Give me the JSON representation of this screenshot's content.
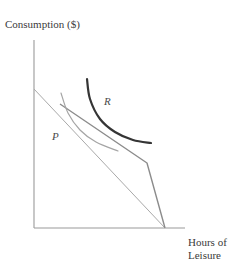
{
  "figure": {
    "type": "economics-indifference-curve-diagram",
    "background_color": "#ffffff",
    "axis_color": "#9a9a9a",
    "y_axis_label": "Consumption ($)",
    "x_axis_label_line1": "Hours of",
    "x_axis_label_line2": "Leisure",
    "curve_labels": {
      "p": "P",
      "r": "R"
    }
  },
  "chart_data": {
    "type": "line",
    "title": "",
    "xlabel": "Hours of Leisure",
    "ylabel": "Consumption ($)",
    "grid": false,
    "legend": "none",
    "axes": {
      "origin_px": [
        34,
        228
      ],
      "x_axis_end_px": [
        185,
        228
      ],
      "y_axis_top_px": [
        34,
        40
      ],
      "xlim_px": [
        34,
        185
      ],
      "ylim_px": [
        228,
        40
      ]
    },
    "series": [
      {
        "name": "original-budget-line",
        "role": "straight budget constraint",
        "color": "#a9a9a9",
        "width": 1,
        "points_px": [
          [
            34,
            89
          ],
          [
            165,
            228
          ]
        ]
      },
      {
        "name": "kinked-budget-line",
        "role": "piecewise budget constraint with welfare program kink",
        "color": "#8c8c8c",
        "width": 1.4,
        "points_px": [
          [
            60,
            104
          ],
          [
            147,
            163
          ],
          [
            165,
            228
          ]
        ]
      },
      {
        "name": "indifference-curve-P",
        "label": "P",
        "color": "#a5a5a5",
        "width": 1.2,
        "points_px": [
          [
            61,
            93
          ],
          [
            68,
            113
          ],
          [
            80,
            130
          ],
          [
            96,
            142
          ],
          [
            118,
            151
          ]
        ]
      },
      {
        "name": "indifference-curve-R",
        "label": "R",
        "color": "#353535",
        "width": 2.2,
        "points_px": [
          [
            87,
            79
          ],
          [
            90,
            99
          ],
          [
            100,
            119
          ],
          [
            115,
            132
          ],
          [
            133,
            140
          ],
          [
            151,
            143
          ]
        ]
      }
    ],
    "annotations": [
      {
        "text": "P",
        "px": [
          52,
          131
        ],
        "style": "italic"
      },
      {
        "text": "R",
        "px": [
          104,
          96
        ],
        "style": "italic"
      }
    ]
  }
}
